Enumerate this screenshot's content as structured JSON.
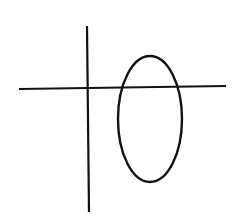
{
  "diagram": {
    "background": "#ffffff",
    "stroke_color": "#111111",
    "horizontal_line": {
      "x1": 19,
      "y1": 89,
      "x2": 226,
      "y2": 86,
      "stroke_width": 2.2
    },
    "vertical_line": {
      "x1": 87,
      "y1": 26,
      "x2": 89,
      "y2": 212,
      "stroke_width": 2.2
    },
    "ellipse": {
      "cx": 150,
      "cy": 119,
      "rx": 32,
      "ry": 63,
      "stroke_width": 2.4
    }
  }
}
